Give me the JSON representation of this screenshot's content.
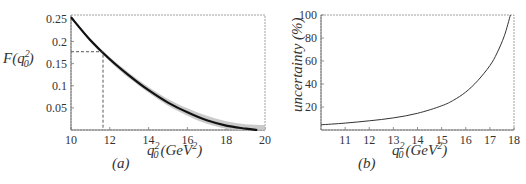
{
  "chart_data": [
    {
      "id": "a",
      "type": "line",
      "caption": "(a)",
      "title": "",
      "xlabel": "q_0^2 (GeV^2)",
      "ylabel": "F(q_0^2)",
      "xlim": [
        10,
        20
      ],
      "ylim": [
        0,
        0.26
      ],
      "xticks": [
        10,
        12,
        14,
        16,
        18,
        20
      ],
      "yticks": [
        0.05,
        0.1,
        0.15,
        0.2,
        0.25
      ],
      "ytick_labels": [
        "0.05",
        "0.1",
        "0.15",
        "0.2",
        "0.25"
      ],
      "grid": false,
      "series": [
        {
          "name": "F(q_0^2) central",
          "color": "#111111",
          "x": [
            10,
            11,
            12,
            13,
            14,
            15,
            16,
            17,
            18,
            19,
            19.6
          ],
          "values": [
            0.255,
            0.203,
            0.16,
            0.123,
            0.09,
            0.062,
            0.04,
            0.022,
            0.01,
            0.003,
            0.0
          ]
        },
        {
          "name": "uncertainty band",
          "color": "#bbbbbb",
          "x": [
            10,
            11,
            12,
            13,
            14,
            15,
            16,
            17,
            18,
            19,
            20
          ],
          "upper": [
            0.258,
            0.207,
            0.165,
            0.129,
            0.097,
            0.07,
            0.049,
            0.032,
            0.02,
            0.013,
            0.011
          ],
          "lower": [
            0.252,
            0.199,
            0.155,
            0.117,
            0.084,
            0.055,
            0.032,
            0.014,
            0.003,
            0.0,
            0.0
          ]
        }
      ],
      "annotations": [
        {
          "type": "dashed-crosshair",
          "x": 11.65,
          "y": 0.177
        }
      ]
    },
    {
      "id": "b",
      "type": "line",
      "caption": "(b)",
      "title": "",
      "xlabel": "q_0^2 (GeV^2)",
      "ylabel": "uncertainty (%)",
      "xlim": [
        10,
        18
      ],
      "ylim": [
        0,
        100
      ],
      "xticks": [
        11,
        12,
        13,
        14,
        15,
        16,
        17,
        18
      ],
      "yticks": [
        20,
        40,
        60,
        80,
        100
      ],
      "grid": false,
      "series": [
        {
          "name": "uncertainty",
          "color": "#222222",
          "x": [
            10,
            11,
            12,
            13,
            14,
            15,
            15.5,
            16,
            16.5,
            17,
            17.3,
            17.6,
            17.85
          ],
          "values": [
            4.5,
            6,
            8,
            10.5,
            14.5,
            21,
            26,
            33,
            43,
            56,
            67,
            82,
            100
          ]
        }
      ]
    }
  ],
  "labels": {
    "a": {
      "ylabel_main": "F(q",
      "ylabel_sup": "2",
      "ylabel_sub": "0",
      "ylabel_close": ")",
      "xlabel_q": "q",
      "xlabel_sup": "2",
      "xlabel_sub": "0",
      "xlabel_unit": "(GeV",
      "xlabel_unit_sup": "2",
      "xlabel_close": ")",
      "caption": "(a)",
      "xticks": [
        "10",
        "12",
        "14",
        "16",
        "18",
        "20"
      ],
      "yticks": [
        "0.05",
        "0.1",
        "0.15",
        "0.2",
        "0.25"
      ]
    },
    "b": {
      "ylabel": "uncertainty (%)",
      "xlabel_q": "q",
      "xlabel_sup": "2",
      "xlabel_sub": "0",
      "xlabel_unit": "(GeV",
      "xlabel_unit_sup": "2",
      "xlabel_close": ")",
      "caption": "(b)",
      "xticks": [
        "11",
        "12",
        "13",
        "14",
        "15",
        "16",
        "17",
        "18"
      ],
      "yticks": [
        "20",
        "40",
        "60",
        "80",
        "100"
      ]
    }
  }
}
